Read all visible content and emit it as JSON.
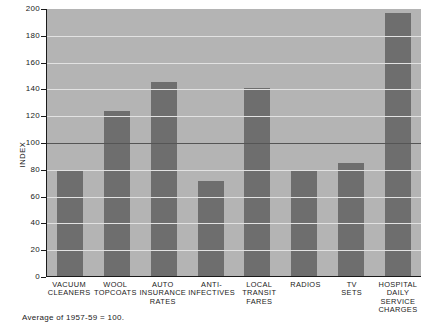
{
  "chart_data": {
    "type": "bar",
    "title": "",
    "subtitle": "",
    "xlabel": "",
    "ylabel": "INDEX",
    "ylim": [
      0,
      200
    ],
    "yticks": [
      0,
      20,
      40,
      60,
      80,
      100,
      120,
      140,
      160,
      180,
      200
    ],
    "grid": true,
    "legend": null,
    "reference_line": {
      "value": 100,
      "label": ""
    },
    "categories": [
      "VACUUM CLEANERS",
      "WOOL TOPCOATS",
      "AUTO INSURANCE RATES",
      "ANTI-INFECTIVES",
      "LOCAL TRANSIT FARES",
      "RADIOS",
      "TV SETS",
      "HOSPITAL DAILY SERVICE CHARGES"
    ],
    "values": [
      79,
      123,
      145,
      71,
      140,
      78,
      84,
      196
    ],
    "annotations": [
      "Average of 1957-59 = 100."
    ]
  },
  "axis": {
    "y_label": "INDEX",
    "tick_labels": [
      "200",
      "180",
      "160",
      "140",
      "120",
      "100",
      "80",
      "60",
      "40",
      "20",
      "0"
    ]
  },
  "categories": [
    {
      "lines": [
        "VACUUM",
        "CLEANERS"
      ]
    },
    {
      "lines": [
        "WOOL",
        "TOPCOATS"
      ]
    },
    {
      "lines": [
        "AUTO",
        "INSURANCE",
        "RATES"
      ]
    },
    {
      "lines": [
        "ANTI-",
        "INFECTIVES"
      ]
    },
    {
      "lines": [
        "LOCAL",
        "TRANSIT",
        "FARES"
      ]
    },
    {
      "lines": [
        "RADIOS"
      ]
    },
    {
      "lines": [
        "TV",
        "SETS"
      ]
    },
    {
      "lines": [
        "HOSPITAL",
        "DAILY",
        "SERVICE",
        "CHARGES"
      ]
    }
  ],
  "footnote": "Average of 1957-59 = 100.",
  "colors": {
    "bar": "#6e6e6e",
    "plot_background": "#b4b4b4",
    "gridline": "#e2e2e2",
    "reference_line": "#555555",
    "axis": "#1a1a1a",
    "page_background": "#ffffff"
  }
}
